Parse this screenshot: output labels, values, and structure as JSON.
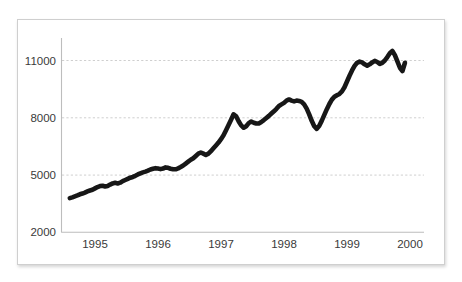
{
  "figure": {
    "background_color": "#ffffff",
    "frame_color": "#cfcfcf",
    "title": ""
  },
  "chart_data": {
    "type": "line",
    "title": "",
    "subtitle": "",
    "xlabel": "",
    "ylabel": "",
    "xlim": [
      1994.5,
      2000.0
    ],
    "ylim": [
      2000,
      11900
    ],
    "grid": true,
    "grid_axis": "y",
    "grid_style": "dotted",
    "legend": false,
    "legend_position": "none",
    "line_color": "#171717",
    "line_width": 4.6,
    "y_ticks": [
      2000,
      5000,
      8000,
      11000
    ],
    "y_tick_labels": [
      "2000",
      "5000",
      "8000",
      "11000"
    ],
    "x_ticks": [
      1995,
      1996,
      1997,
      1998,
      1999,
      2000
    ],
    "x_tick_labels": [
      "1995",
      "1996",
      "1997",
      "1998",
      "1999",
      "2000"
    ],
    "series": [
      {
        "name": "Index",
        "x": [
          1994.6,
          1994.64,
          1994.68,
          1994.72,
          1994.76,
          1994.8,
          1994.84,
          1994.88,
          1994.92,
          1994.96,
          1995.0,
          1995.04,
          1995.08,
          1995.12,
          1995.16,
          1995.2,
          1995.24,
          1995.28,
          1995.32,
          1995.36,
          1995.4,
          1995.44,
          1995.48,
          1995.52,
          1995.56,
          1995.6,
          1995.64,
          1995.68,
          1995.72,
          1995.76,
          1995.8,
          1995.84,
          1995.88,
          1995.92,
          1995.96,
          1996.0,
          1996.04,
          1996.08,
          1996.12,
          1996.16,
          1996.2,
          1996.24,
          1996.28,
          1996.32,
          1996.36,
          1996.4,
          1996.44,
          1996.48,
          1996.52,
          1996.56,
          1996.6,
          1996.64,
          1996.68,
          1996.72,
          1996.76,
          1996.8,
          1996.84,
          1996.88,
          1996.92,
          1996.96,
          1997.0,
          1997.04,
          1997.08,
          1997.12,
          1997.16,
          1997.2,
          1997.24,
          1997.28,
          1997.32,
          1997.36,
          1997.4,
          1997.44,
          1997.48,
          1997.52,
          1997.56,
          1997.6,
          1997.64,
          1997.68,
          1997.72,
          1997.76,
          1997.8,
          1997.84,
          1997.88,
          1997.92,
          1997.96,
          1998.0,
          1998.04,
          1998.08,
          1998.12,
          1998.16,
          1998.2,
          1998.24,
          1998.28,
          1998.32,
          1998.36,
          1998.4,
          1998.44,
          1998.48,
          1998.52,
          1998.56,
          1998.6,
          1998.64,
          1998.68,
          1998.72,
          1998.76,
          1998.8,
          1998.84,
          1998.88,
          1998.92,
          1998.96,
          1999.0,
          1999.04,
          1999.08,
          1999.12,
          1999.16,
          1999.2,
          1999.24,
          1999.28,
          1999.32,
          1999.36,
          1999.4,
          1999.44,
          1999.48,
          1999.52,
          1999.56,
          1999.6,
          1999.64,
          1999.68,
          1999.72,
          1999.76,
          1999.8,
          1999.84,
          1999.88,
          1999.92
        ],
        "values": [
          3790,
          3830,
          3880,
          3930,
          3990,
          4030,
          4080,
          4140,
          4190,
          4230,
          4300,
          4370,
          4420,
          4440,
          4400,
          4430,
          4500,
          4560,
          4590,
          4560,
          4600,
          4680,
          4740,
          4800,
          4860,
          4900,
          4960,
          5030,
          5090,
          5140,
          5180,
          5230,
          5290,
          5330,
          5360,
          5340,
          5310,
          5340,
          5400,
          5380,
          5330,
          5300,
          5300,
          5350,
          5420,
          5500,
          5600,
          5700,
          5800,
          5880,
          6000,
          6120,
          6180,
          6120,
          6050,
          6120,
          6250,
          6400,
          6550,
          6700,
          6880,
          7080,
          7350,
          7620,
          7900,
          8180,
          8080,
          7820,
          7600,
          7480,
          7560,
          7720,
          7800,
          7740,
          7700,
          7700,
          7780,
          7880,
          7990,
          8100,
          8220,
          8340,
          8470,
          8620,
          8700,
          8780,
          8900,
          8960,
          8900,
          8860,
          8900,
          8880,
          8830,
          8700,
          8480,
          8180,
          7840,
          7560,
          7420,
          7580,
          7850,
          8150,
          8450,
          8720,
          8950,
          9100,
          9180,
          9250,
          9380,
          9600,
          9900,
          10200,
          10480,
          10720,
          10880,
          10940,
          10900,
          10800,
          10730,
          10800,
          10900,
          10980,
          10920,
          10820,
          10880,
          11000,
          11180,
          11380,
          11500,
          11280,
          10950,
          10620,
          10450,
          10880
        ]
      }
    ]
  },
  "axes": {
    "y_axis_name": "value-axis",
    "x_axis_name": "time-axis"
  }
}
